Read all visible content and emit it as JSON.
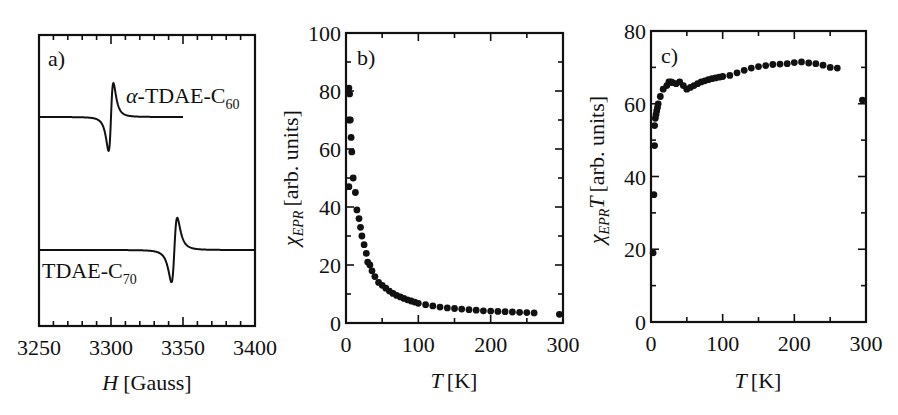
{
  "chart_data": [
    {
      "panel": "a)",
      "type": "line",
      "title": "",
      "xlabel": "H [Gauss]",
      "xlabel_var": "H",
      "xlabel_unit": "[Gauss]",
      "ylabel": "",
      "xlim": [
        3250,
        3400
      ],
      "xticks": [
        3250,
        3300,
        3350,
        3400
      ],
      "minor_tick_step": 10,
      "grid": false,
      "legend": "inline labels",
      "series": [
        {
          "name": "α-TDAE-C60",
          "label_main": "-TDAE-C",
          "label_prefix": "α",
          "label_sub": "60",
          "shape": "EPR derivative line",
          "center_field": 3300,
          "peak_to_peak_width": 5,
          "x_range": [
            3250,
            3350
          ],
          "amplitude_relative": 1.0
        },
        {
          "name": "TDAE-C70",
          "label_main": "TDAE-C",
          "label_sub": "70",
          "shape": "EPR derivative line",
          "center_field": 3344,
          "peak_to_peak_width": 6,
          "x_range": [
            3250,
            3400
          ],
          "amplitude_relative": 0.95
        }
      ]
    },
    {
      "panel": "b)",
      "type": "scatter",
      "title": "",
      "xlabel": "T [K]",
      "xlabel_var": "T",
      "xlabel_unit": "[K]",
      "ylabel": "χ_EPR [arb. units]",
      "ylabel_sym": "χ",
      "ylabel_sub": "EPR",
      "ylabel_unit": "[arb. units]",
      "xlim": [
        0,
        300
      ],
      "ylim": [
        0,
        100
      ],
      "xticks": [
        0,
        100,
        200,
        300
      ],
      "yticks": [
        0,
        20,
        40,
        60,
        80,
        100
      ],
      "grid": false,
      "series": [
        {
          "name": "χ_EPR",
          "x": [
            4,
            4,
            5,
            4,
            6,
            7,
            8,
            10,
            13,
            15,
            18,
            20,
            22,
            25,
            28,
            30,
            33,
            36,
            40,
            45,
            50,
            55,
            60,
            65,
            70,
            75,
            80,
            85,
            90,
            95,
            100,
            110,
            120,
            130,
            140,
            150,
            160,
            170,
            180,
            190,
            200,
            210,
            220,
            230,
            240,
            250,
            260,
            295
          ],
          "y": [
            47,
            81,
            79,
            70,
            70,
            64,
            59,
            50,
            45,
            39,
            36,
            33,
            30,
            27,
            24,
            21,
            20,
            18,
            16,
            14,
            13,
            12,
            11,
            10.2,
            9.5,
            9,
            8.5,
            8,
            7.6,
            7.2,
            6.8,
            6.3,
            5.9,
            5.5,
            5.2,
            5,
            4.8,
            4.6,
            4.4,
            4.2,
            4.1,
            4,
            3.9,
            3.8,
            3.7,
            3.6,
            3.5,
            3
          ]
        }
      ]
    },
    {
      "panel": "c)",
      "type": "scatter",
      "title": "",
      "xlabel": "T [K]",
      "xlabel_var": "T",
      "xlabel_unit": "[K]",
      "ylabel": "χ_EPR T [arb. units]",
      "ylabel_sym": "χ",
      "ylabel_sub": "EPR",
      "ylabel_var": "T",
      "ylabel_unit": "[arb. units]",
      "xlim": [
        0,
        300
      ],
      "ylim": [
        0,
        80
      ],
      "xticks": [
        0,
        100,
        200,
        300
      ],
      "yticks": [
        0,
        20,
        40,
        60,
        80
      ],
      "grid": false,
      "series": [
        {
          "name": "χ_EPR T",
          "x": [
            3,
            4,
            5,
            5,
            6,
            7,
            8,
            9,
            10,
            13,
            17,
            22,
            25,
            28,
            30,
            35,
            40,
            45,
            50,
            55,
            60,
            65,
            70,
            75,
            80,
            85,
            90,
            95,
            100,
            110,
            120,
            130,
            140,
            150,
            160,
            170,
            180,
            190,
            200,
            210,
            220,
            230,
            240,
            250,
            260,
            295
          ],
          "y": [
            19,
            35,
            48.5,
            54,
            56,
            57,
            58,
            59,
            60,
            62,
            64,
            65,
            66,
            66,
            65.8,
            65.5,
            66,
            65,
            64,
            64.5,
            65,
            65.5,
            66,
            66.3,
            66.6,
            66.9,
            67.1,
            67.3,
            67.5,
            67.8,
            68.5,
            69.2,
            69.8,
            70.2,
            70.5,
            70.8,
            70.9,
            71,
            71.3,
            71.5,
            71.2,
            71,
            70.6,
            70,
            69.8,
            61
          ]
        }
      ]
    }
  ]
}
